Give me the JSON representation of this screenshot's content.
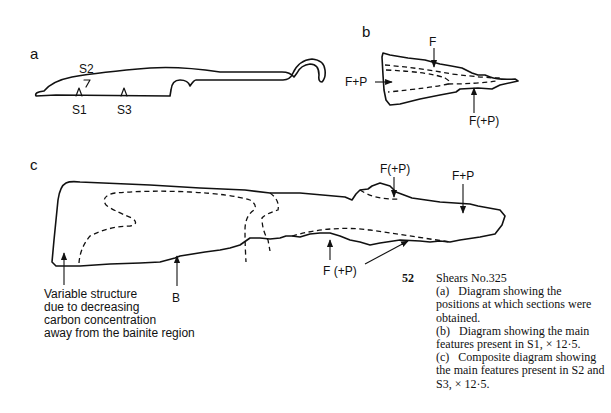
{
  "panels": {
    "a": {
      "letter": "a",
      "section_labels": [
        "S2",
        "S1",
        "S3"
      ]
    },
    "b": {
      "letter": "b",
      "labels": {
        "top": "F",
        "left": "F+P",
        "bottom": "F(+P)"
      }
    },
    "c": {
      "letter": "c",
      "labels": {
        "top_mid": "F(+P)",
        "top_right": "F+P",
        "bottom_mid": "F (+P)",
        "bainite": "B"
      },
      "note_lines": [
        "Variable structure",
        "due to decreasing",
        "carbon concentration",
        "away from the bainite region"
      ]
    }
  },
  "caption": {
    "number": "52",
    "title": "Shears No.325",
    "items": [
      {
        "tag": "(a)",
        "text": "Diagram showing the positions at which sections were obtained."
      },
      {
        "tag": "(b)",
        "text": "Diagram showing the main features present in S1, × 12·5."
      },
      {
        "tag": "(c)",
        "text": "Composite diagram showing the main features present in S2 and S3, × 12·5."
      }
    ]
  }
}
